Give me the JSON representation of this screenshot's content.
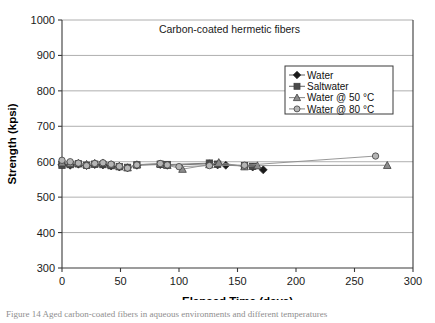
{
  "figure": {
    "caption": "Figure 14 Aged carbon-coated fibers in aqueous environments and different temperatures"
  },
  "chart_data": {
    "type": "scatter",
    "title": "Carbon-coated hermetic fibers",
    "xlabel": "Elapsed Time (days)",
    "ylabel": "Strength (kpsi)",
    "xlim": [
      0,
      300
    ],
    "ylim": [
      300,
      1000
    ],
    "xticks": [
      0,
      50,
      100,
      150,
      200,
      250,
      300
    ],
    "yticks": [
      300,
      400,
      500,
      600,
      700,
      800,
      900,
      1000
    ],
    "grid": "horizontal",
    "legend_position": "upper-right-inside",
    "series": [
      {
        "name": "Water",
        "marker": "diamond",
        "color": "#1a1a1a",
        "line_color": "#6e6e6e",
        "x": [
          0,
          7,
          14,
          21,
          28,
          35,
          42,
          49,
          56,
          64,
          84,
          90,
          126,
          133,
          140,
          156,
          163,
          172
        ],
        "y": [
          592,
          590,
          593,
          589,
          592,
          591,
          588,
          585,
          583,
          590,
          592,
          590,
          594,
          591,
          590,
          588,
          585,
          577
        ]
      },
      {
        "name": "Saltwater",
        "marker": "square",
        "color": "#4a4a4a",
        "line_color": "#6e6e6e",
        "x": [
          0,
          7,
          14,
          21,
          28,
          35,
          42,
          49,
          56,
          64,
          84,
          90,
          126,
          133,
          156,
          163
        ],
        "y": [
          590,
          592,
          594,
          590,
          593,
          592,
          589,
          586,
          584,
          591,
          593,
          592,
          596,
          593,
          589,
          587
        ]
      },
      {
        "name": "Water @ 50 °C",
        "marker": "triangle",
        "color": "#8c8c8c",
        "line_color": "#8c8c8c",
        "x": [
          0,
          7,
          14,
          21,
          28,
          35,
          42,
          49,
          56,
          64,
          84,
          90,
          103,
          126,
          134,
          156,
          167,
          278
        ],
        "y": [
          597,
          595,
          596,
          593,
          596,
          597,
          592,
          588,
          583,
          592,
          594,
          590,
          579,
          592,
          598,
          586,
          589,
          590
        ]
      },
      {
        "name": "Water @ 80 °C",
        "marker": "circle",
        "color": "#b5b5b5",
        "line_color": "#8c8c8c",
        "x": [
          0,
          7,
          14,
          21,
          28,
          35,
          42,
          49,
          56,
          64,
          84,
          90,
          100,
          126,
          156,
          268
        ],
        "y": [
          604,
          600,
          596,
          589,
          595,
          597,
          593,
          587,
          582,
          591,
          595,
          591,
          586,
          589,
          590,
          616
        ]
      }
    ]
  }
}
